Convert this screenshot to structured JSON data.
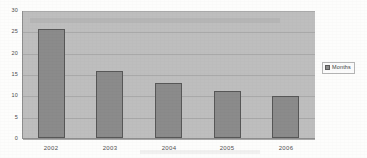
{
  "chart_data": {
    "type": "bar",
    "title": "",
    "xlabel": "",
    "ylabel": "",
    "categories": [
      "2002",
      "2003",
      "2004",
      "2005",
      "2006"
    ],
    "series": [
      {
        "name": "Months",
        "values": [
          25.5,
          15.6,
          12.8,
          11.1,
          9.9
        ]
      }
    ],
    "ylim": [
      0,
      30
    ],
    "ytick_labels": [
      "0",
      "5",
      "10",
      "15",
      "20",
      "25",
      "30"
    ],
    "ytick_values": [
      0,
      5,
      10,
      15,
      20,
      25,
      30
    ],
    "grid": true,
    "legend_position": "right",
    "legend_entries": [
      "Months"
    ],
    "colors": {
      "bar_fill": "#8b8b8b",
      "bar_outline": "#575757",
      "plot_background": "#bebebe",
      "gridline": "#a9a9a9",
      "page_background": "#fdfdfc",
      "axis_text": "#4f4f4f"
    }
  }
}
